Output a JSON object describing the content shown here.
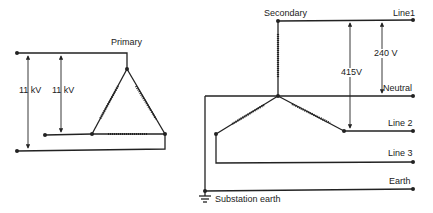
{
  "primary": {
    "title": "Primary",
    "voltage_outer": "11 kV",
    "voltage_inner": "11 kV"
  },
  "secondary": {
    "title": "Secondary",
    "voltage_line_line": "415V",
    "voltage_line_neutral": "240 V",
    "outputs": [
      "Line1",
      "Neutral",
      "Line 2",
      "Line 3",
      "Earth"
    ],
    "ground_label": "Substation earth"
  },
  "colors": {
    "ink": "#222222",
    "background": "#ffffff"
  }
}
